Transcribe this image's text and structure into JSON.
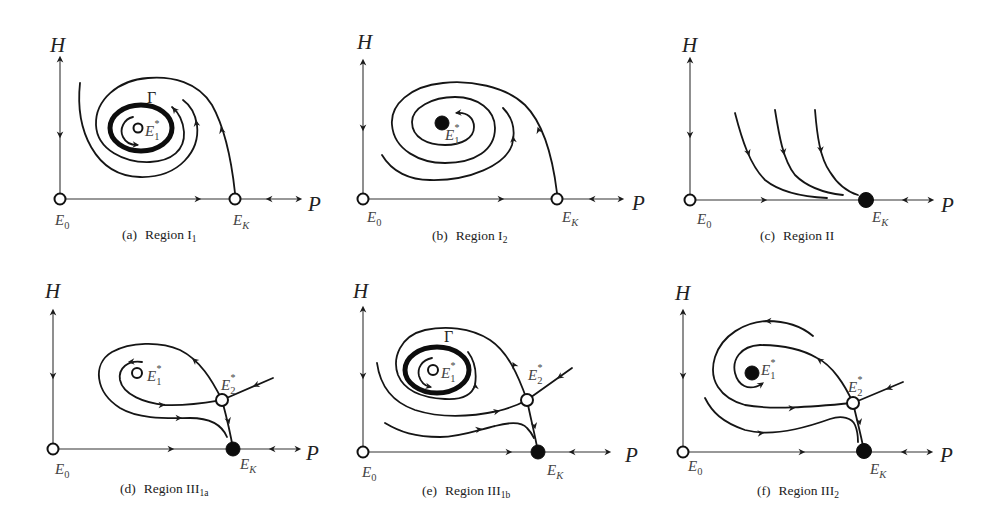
{
  "figure": {
    "axis": {
      "vertical": "H",
      "horizontal": "P"
    },
    "symbols": {
      "E": "E",
      "gamma": "Γ"
    },
    "panels": [
      {
        "tag": "(a)",
        "region": "Region I",
        "region_sub": "1",
        "points": {
          "E0": {
            "sub": "0",
            "marker": "open"
          },
          "EK": {
            "sub": "K",
            "marker": "open"
          },
          "E1": {
            "sub": "1",
            "sup": "*",
            "marker": "open"
          }
        },
        "limit_cycle": "Γ"
      },
      {
        "tag": "(b)",
        "region": "Region I",
        "region_sub": "2",
        "points": {
          "E0": {
            "sub": "0",
            "marker": "open"
          },
          "EK": {
            "sub": "K",
            "marker": "open"
          },
          "E1": {
            "sub": "1",
            "sup": "*",
            "marker": "filled"
          }
        }
      },
      {
        "tag": "(c)",
        "region": "Region II",
        "region_sub": "",
        "points": {
          "E0": {
            "sub": "0",
            "marker": "open"
          },
          "EK": {
            "sub": "K",
            "marker": "filled"
          }
        }
      },
      {
        "tag": "(d)",
        "region": "Region III",
        "region_sub": "1a",
        "points": {
          "E0": {
            "sub": "0",
            "marker": "open"
          },
          "EK": {
            "sub": "K",
            "marker": "filled"
          },
          "E1": {
            "sub": "1",
            "sup": "*",
            "marker": "open"
          },
          "E2": {
            "sub": "2",
            "sup": "*",
            "marker": "open"
          }
        }
      },
      {
        "tag": "(e)",
        "region": "Region III",
        "region_sub": "1b",
        "points": {
          "E0": {
            "sub": "0",
            "marker": "open"
          },
          "EK": {
            "sub": "K",
            "marker": "filled"
          },
          "E1": {
            "sub": "1",
            "sup": "*",
            "marker": "open"
          },
          "E2": {
            "sub": "2",
            "sup": "*",
            "marker": "open"
          }
        },
        "limit_cycle": "Γ"
      },
      {
        "tag": "(f)",
        "region": "Region III",
        "region_sub": "2",
        "points": {
          "E0": {
            "sub": "0",
            "marker": "open"
          },
          "EK": {
            "sub": "K",
            "marker": "filled"
          },
          "E1": {
            "sub": "1",
            "sup": "*",
            "marker": "filled"
          },
          "E2": {
            "sub": "2",
            "sup": "*",
            "marker": "open"
          }
        }
      }
    ]
  }
}
